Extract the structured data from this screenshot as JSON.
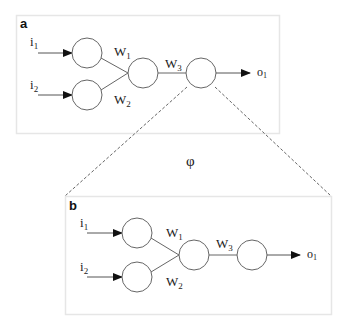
{
  "figure": {
    "panel_a": {
      "label": "a",
      "inputs": [
        "i",
        "i"
      ],
      "input_subs": [
        "1",
        "2"
      ],
      "weights": [
        "W",
        "W",
        "W"
      ],
      "weight_subs": [
        "1",
        "2",
        "3"
      ],
      "output": "o",
      "output_sub": "1"
    },
    "mapping_symbol": "φ",
    "panel_b": {
      "label": "b",
      "inputs": [
        "i",
        "i"
      ],
      "input_subs": [
        "1",
        "2"
      ],
      "weights": [
        "W",
        "W",
        "W"
      ],
      "weight_subs": [
        "1",
        "2",
        "3"
      ],
      "output": "o",
      "output_sub": "1"
    },
    "colors": {
      "line": "#555555",
      "box_border": "#e6e6e6",
      "dash": "#666666"
    }
  }
}
